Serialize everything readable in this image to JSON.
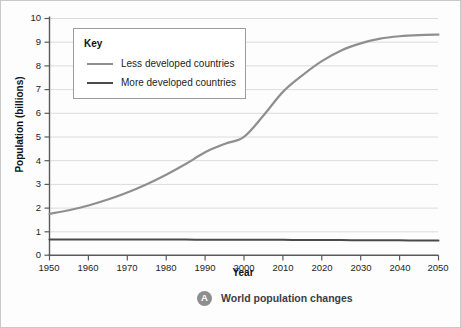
{
  "chart_data": {
    "type": "line",
    "title": "",
    "xlabel": "Year",
    "ylabel": "Population (billions)",
    "xlim": [
      1950,
      2050
    ],
    "ylim": [
      0,
      10
    ],
    "xticks": [
      "1950",
      "1960",
      "1970",
      "1980",
      "1990",
      "2000",
      "2010",
      "2020",
      "2030",
      "2040",
      "2050"
    ],
    "yticks": [
      "0",
      "1",
      "2",
      "3",
      "4",
      "5",
      "6",
      "7",
      "8",
      "9",
      "10"
    ],
    "grid": "horizontal",
    "legend_position": "upper-left-inset",
    "legend_title": "Key",
    "x": [
      1950,
      1955,
      1960,
      1965,
      1970,
      1975,
      1980,
      1985,
      1990,
      1995,
      2000,
      2005,
      2010,
      2015,
      2020,
      2025,
      2030,
      2035,
      2040,
      2045,
      2050
    ],
    "series": [
      {
        "name": "Less developed countries",
        "color": "#8f8f8f",
        "values": [
          1.75,
          1.9,
          2.1,
          2.35,
          2.65,
          3.0,
          3.4,
          3.85,
          4.35,
          4.7,
          5.0,
          5.9,
          6.9,
          7.6,
          8.2,
          8.65,
          8.95,
          9.15,
          9.25,
          9.3,
          9.32
        ]
      },
      {
        "name": "More developed countries",
        "color": "#4a4a4a",
        "values": [
          0.66,
          0.66,
          0.66,
          0.66,
          0.66,
          0.66,
          0.66,
          0.66,
          0.65,
          0.65,
          0.65,
          0.65,
          0.65,
          0.64,
          0.64,
          0.64,
          0.63,
          0.63,
          0.63,
          0.62,
          0.62
        ]
      }
    ]
  },
  "legend": {
    "title": "Key",
    "items": [
      {
        "label": "Less developed countries"
      },
      {
        "label": "More developed countries"
      }
    ]
  },
  "caption": {
    "badge": "A",
    "text": "World population changes"
  }
}
